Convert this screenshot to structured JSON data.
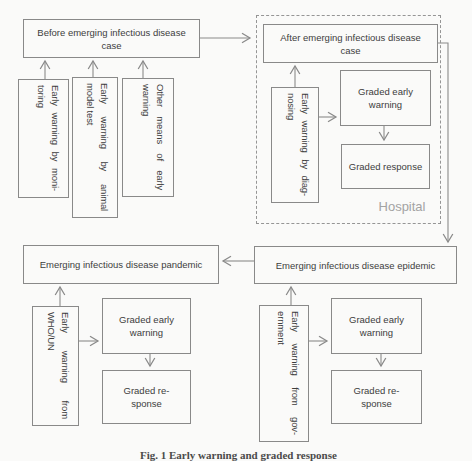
{
  "colors": {
    "line": "#8a8a8a",
    "box_border": "#898989",
    "text": "#3d3d3d",
    "muted_label": "#a3a3a3",
    "background": "#fafaf9"
  },
  "diagram": {
    "before_box": {
      "line1": "Before emerging infectious disease",
      "line2": "case"
    },
    "monitoring_box": {
      "line1": "Early warning by moni-",
      "line2": "toring"
    },
    "animal_box": {
      "line1": "Early warning by animal",
      "line2": "model test"
    },
    "other_box": {
      "line1": "Other means of early",
      "line2": "warning"
    },
    "after_box": {
      "line1": "After emerging infectious disease",
      "line2": "case"
    },
    "diagnosing_box": {
      "line1": "Early warning by diag-",
      "line2": "nosing"
    },
    "hospital_graded_early_warning": {
      "line1": "Graded early",
      "line2": "warning"
    },
    "hospital_graded_response": {
      "line1": "Graded response"
    },
    "hospital_label": "Hospital",
    "pandemic_box": {
      "line1": "Emerging infectious disease pandemic"
    },
    "who_box": {
      "line1": "Early warning from",
      "line2": "WHO/UN"
    },
    "pandemic_graded_early_warning": {
      "line1": "Graded early",
      "line2": "warning"
    },
    "pandemic_graded_response": {
      "line1": "Graded re-",
      "line2": "sponse"
    },
    "epidemic_box": {
      "line1": "Emerging infectious disease epidemic"
    },
    "government_box": {
      "line1": "Early warning from gov-",
      "line2": "ernment"
    },
    "epidemic_graded_early_warning": {
      "line1": "Graded early",
      "line2": "warning"
    },
    "epidemic_graded_response": {
      "line1": "Graded re-",
      "line2": "sponse"
    }
  },
  "caption": "Fig. 1 Early warning and graded response"
}
